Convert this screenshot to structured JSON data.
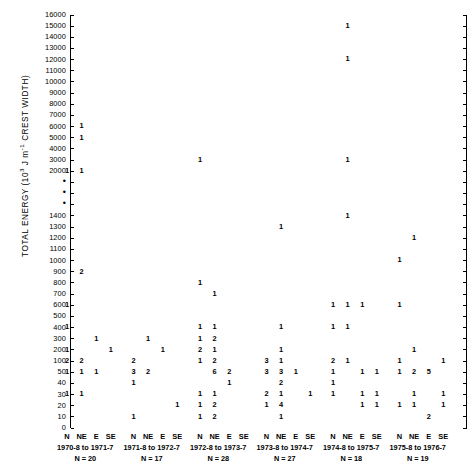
{
  "chart_data": {
    "type": "scatter",
    "title": "",
    "ylabel": "TOTAL ENERGY (10^3 J m^-1 CREST WIDTH)",
    "ylabel_parts": {
      "pre": "TOTAL ENERGY (10",
      "sup": "3",
      "mid": " J m",
      "sup2": "-1",
      "post": " CREST WIDTH)"
    },
    "xlabel": "",
    "grid": false,
    "legend": null,
    "axis_break": {
      "between": [
        2000,
        1400
      ],
      "marker": "three dots"
    },
    "yticks": [
      16000,
      15000,
      14000,
      13000,
      12000,
      11000,
      10000,
      9000,
      8000,
      7000,
      6000,
      5000,
      4000,
      3000,
      2000,
      "dot",
      "dot",
      "dot",
      1400,
      1300,
      1200,
      1100,
      1000,
      900,
      800,
      700,
      600,
      500,
      400,
      300,
      200,
      100,
      50,
      40,
      30,
      20,
      10,
      0
    ],
    "directions": [
      "N",
      "NE",
      "E",
      "SE"
    ],
    "groups": [
      {
        "period": "1970-8 to 1971-7",
        "n_label": "N = 20",
        "n": 20
      },
      {
        "period": "1971-8 to 1972-7",
        "n_label": "N = 17",
        "n": 17
      },
      {
        "period": "1972-8 to 1973-7",
        "n_label": "N = 28",
        "n": 28
      },
      {
        "period": "1973-8 to 1974-7",
        "n_label": "N = 27",
        "n": 27
      },
      {
        "period": "1974-8 to 1975-7",
        "n_label": "N = 18",
        "n": 18
      },
      {
        "period": "1975-8 to 1976-7",
        "n_label": "N = 19",
        "n": 19
      }
    ],
    "points": [
      {
        "group": 0,
        "dir": "NE",
        "y": 6000,
        "value": "1"
      },
      {
        "group": 0,
        "dir": "NE",
        "y": 5000,
        "value": "1"
      },
      {
        "group": 0,
        "dir": "N",
        "y": 2000,
        "value": "1"
      },
      {
        "group": 0,
        "dir": "NE",
        "y": 2000,
        "value": "1"
      },
      {
        "group": 0,
        "dir": "NE",
        "y": 900,
        "value": "2"
      },
      {
        "group": 0,
        "dir": "N",
        "y": 600,
        "value": "1"
      },
      {
        "group": 0,
        "dir": "N",
        "y": 400,
        "value": "1"
      },
      {
        "group": 0,
        "dir": "E",
        "y": 300,
        "value": "1"
      },
      {
        "group": 0,
        "dir": "N",
        "y": 200,
        "value": "1"
      },
      {
        "group": 0,
        "dir": "SE",
        "y": 200,
        "value": "1"
      },
      {
        "group": 0,
        "dir": "N",
        "y": 100,
        "value": "2"
      },
      {
        "group": 0,
        "dir": "NE",
        "y": 100,
        "value": "2"
      },
      {
        "group": 0,
        "dir": "N",
        "y": 50,
        "value": "1"
      },
      {
        "group": 0,
        "dir": "NE",
        "y": 50,
        "value": "1"
      },
      {
        "group": 0,
        "dir": "E",
        "y": 50,
        "value": "1"
      },
      {
        "group": 0,
        "dir": "N",
        "y": 30,
        "value": "1"
      },
      {
        "group": 0,
        "dir": "NE",
        "y": 30,
        "value": "1"
      },
      {
        "group": 1,
        "dir": "NE",
        "y": 300,
        "value": "1"
      },
      {
        "group": 1,
        "dir": "E",
        "y": 200,
        "value": "1"
      },
      {
        "group": 1,
        "dir": "N",
        "y": 100,
        "value": "2"
      },
      {
        "group": 1,
        "dir": "N",
        "y": 50,
        "value": "3"
      },
      {
        "group": 1,
        "dir": "NE",
        "y": 50,
        "value": "2"
      },
      {
        "group": 1,
        "dir": "N",
        "y": 40,
        "value": "1"
      },
      {
        "group": 1,
        "dir": "SE",
        "y": 20,
        "value": "1"
      },
      {
        "group": 1,
        "dir": "N",
        "y": 10,
        "value": "1"
      },
      {
        "group": 2,
        "dir": "N",
        "y": 3000,
        "value": "1"
      },
      {
        "group": 2,
        "dir": "N",
        "y": 800,
        "value": "1"
      },
      {
        "group": 2,
        "dir": "NE",
        "y": 700,
        "value": "1"
      },
      {
        "group": 2,
        "dir": "N",
        "y": 400,
        "value": "1"
      },
      {
        "group": 2,
        "dir": "NE",
        "y": 400,
        "value": "1"
      },
      {
        "group": 2,
        "dir": "N",
        "y": 300,
        "value": "1"
      },
      {
        "group": 2,
        "dir": "NE",
        "y": 300,
        "value": "2"
      },
      {
        "group": 2,
        "dir": "N",
        "y": 200,
        "value": "2"
      },
      {
        "group": 2,
        "dir": "NE",
        "y": 200,
        "value": "1"
      },
      {
        "group": 2,
        "dir": "N",
        "y": 100,
        "value": "1"
      },
      {
        "group": 2,
        "dir": "NE",
        "y": 100,
        "value": "2"
      },
      {
        "group": 2,
        "dir": "NE",
        "y": 50,
        "value": "6"
      },
      {
        "group": 2,
        "dir": "E",
        "y": 50,
        "value": "2"
      },
      {
        "group": 2,
        "dir": "E",
        "y": 40,
        "value": "1"
      },
      {
        "group": 2,
        "dir": "N",
        "y": 30,
        "value": "1"
      },
      {
        "group": 2,
        "dir": "NE",
        "y": 30,
        "value": "1"
      },
      {
        "group": 2,
        "dir": "N",
        "y": 20,
        "value": "1"
      },
      {
        "group": 2,
        "dir": "NE",
        "y": 20,
        "value": "2"
      },
      {
        "group": 2,
        "dir": "N",
        "y": 10,
        "value": "1"
      },
      {
        "group": 2,
        "dir": "NE",
        "y": 10,
        "value": "2"
      },
      {
        "group": 3,
        "dir": "NE",
        "y": 1300,
        "value": "1"
      },
      {
        "group": 3,
        "dir": "NE",
        "y": 400,
        "value": "1"
      },
      {
        "group": 3,
        "dir": "NE",
        "y": 200,
        "value": "1"
      },
      {
        "group": 3,
        "dir": "N",
        "y": 100,
        "value": "3"
      },
      {
        "group": 3,
        "dir": "NE",
        "y": 100,
        "value": "1"
      },
      {
        "group": 3,
        "dir": "N",
        "y": 50,
        "value": "3"
      },
      {
        "group": 3,
        "dir": "NE",
        "y": 50,
        "value": "3"
      },
      {
        "group": 3,
        "dir": "E",
        "y": 50,
        "value": "1"
      },
      {
        "group": 3,
        "dir": "NE",
        "y": 40,
        "value": "2"
      },
      {
        "group": 3,
        "dir": "SE",
        "y": 30,
        "value": "1"
      },
      {
        "group": 3,
        "dir": "N",
        "y": 30,
        "value": "2"
      },
      {
        "group": 3,
        "dir": "NE",
        "y": 30,
        "value": "1"
      },
      {
        "group": 3,
        "dir": "N",
        "y": 20,
        "value": "1"
      },
      {
        "group": 3,
        "dir": "NE",
        "y": 20,
        "value": "4"
      },
      {
        "group": 3,
        "dir": "NE",
        "y": 10,
        "value": "1"
      },
      {
        "group": 4,
        "dir": "NE",
        "y": 15000,
        "value": "1"
      },
      {
        "group": 4,
        "dir": "NE",
        "y": 12000,
        "value": "1"
      },
      {
        "group": 4,
        "dir": "NE",
        "y": 3000,
        "value": "1"
      },
      {
        "group": 4,
        "dir": "NE",
        "y": 1400,
        "value": "1"
      },
      {
        "group": 4,
        "dir": "N",
        "y": 600,
        "value": "1"
      },
      {
        "group": 4,
        "dir": "NE",
        "y": 600,
        "value": "1"
      },
      {
        "group": 4,
        "dir": "E",
        "y": 600,
        "value": "1"
      },
      {
        "group": 4,
        "dir": "N",
        "y": 400,
        "value": "1"
      },
      {
        "group": 4,
        "dir": "NE",
        "y": 400,
        "value": "1"
      },
      {
        "group": 4,
        "dir": "N",
        "y": 100,
        "value": "2"
      },
      {
        "group": 4,
        "dir": "NE",
        "y": 100,
        "value": "1"
      },
      {
        "group": 4,
        "dir": "N",
        "y": 50,
        "value": "1"
      },
      {
        "group": 4,
        "dir": "E",
        "y": 50,
        "value": "1"
      },
      {
        "group": 4,
        "dir": "SE",
        "y": 50,
        "value": "1"
      },
      {
        "group": 4,
        "dir": "N",
        "y": 40,
        "value": "1"
      },
      {
        "group": 4,
        "dir": "N",
        "y": 30,
        "value": "1"
      },
      {
        "group": 4,
        "dir": "E",
        "y": 30,
        "value": "1"
      },
      {
        "group": 4,
        "dir": "SE",
        "y": 30,
        "value": "1"
      },
      {
        "group": 4,
        "dir": "E",
        "y": 20,
        "value": "1"
      },
      {
        "group": 4,
        "dir": "SE",
        "y": 20,
        "value": "1"
      },
      {
        "group": 5,
        "dir": "NE",
        "y": 1200,
        "value": "1"
      },
      {
        "group": 5,
        "dir": "N",
        "y": 1000,
        "value": "1"
      },
      {
        "group": 5,
        "dir": "N",
        "y": 600,
        "value": "1"
      },
      {
        "group": 5,
        "dir": "NE",
        "y": 200,
        "value": "1"
      },
      {
        "group": 5,
        "dir": "N",
        "y": 100,
        "value": "1"
      },
      {
        "group": 5,
        "dir": "SE",
        "y": 100,
        "value": "1"
      },
      {
        "group": 5,
        "dir": "N",
        "y": 50,
        "value": "1"
      },
      {
        "group": 5,
        "dir": "NE",
        "y": 50,
        "value": "2"
      },
      {
        "group": 5,
        "dir": "E",
        "y": 50,
        "value": "5"
      },
      {
        "group": 5,
        "dir": "NE",
        "y": 30,
        "value": "1"
      },
      {
        "group": 5,
        "dir": "SE",
        "y": 30,
        "value": "1"
      },
      {
        "group": 5,
        "dir": "N",
        "y": 20,
        "value": "1"
      },
      {
        "group": 5,
        "dir": "NE",
        "y": 20,
        "value": "1"
      },
      {
        "group": 5,
        "dir": "SE",
        "y": 20,
        "value": "1"
      },
      {
        "group": 5,
        "dir": "E",
        "y": 10,
        "value": "2"
      }
    ]
  }
}
